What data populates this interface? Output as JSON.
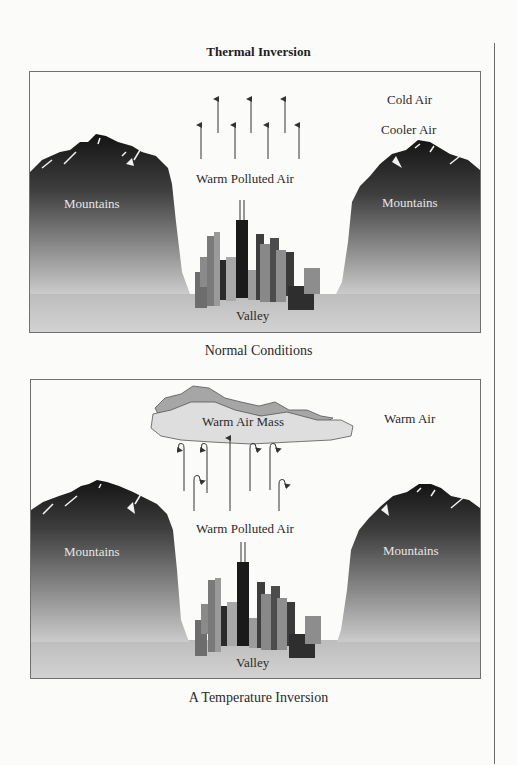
{
  "title": "Thermal Inversion",
  "colors": {
    "mountain_top": "#141414",
    "mountain_bottom": "#c8c8c8",
    "cloud_fill": "#dedede",
    "cloud_shadow": "#a6a6a6",
    "border": "#707070",
    "background": "#fbfbfa"
  },
  "panels": [
    {
      "caption": "Normal Conditions",
      "labels": {
        "top_right": "Cold Air",
        "middle_right": "Cooler Air",
        "center": "Warm Polluted Air",
        "left_mountain": "Mountains",
        "right_mountain": "Mountains",
        "valley": "Valley"
      },
      "arrows": "straight-upward",
      "arrow_count": 7
    },
    {
      "caption": "A Temperature Inversion",
      "labels": {
        "cloud": "Warm Air Mass",
        "top_right": "Warm Air",
        "center": "Warm Polluted Air",
        "left_mountain": "Mountains",
        "right_mountain": "Mountains",
        "valley": "Valley"
      },
      "arrows": "upward-curling-back-down",
      "arrow_count": 7
    }
  ]
}
